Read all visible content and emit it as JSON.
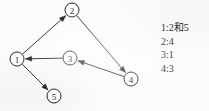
{
  "diagram": {
    "background_color": "#fcfcfc",
    "ink_color": "#1a1a1a",
    "nodes": [
      {
        "id": "1",
        "label": "1",
        "x": 17,
        "y": 59,
        "r": 7
      },
      {
        "id": "2",
        "label": "2",
        "x": 72,
        "y": 10,
        "r": 7
      },
      {
        "id": "3",
        "label": "3",
        "x": 70,
        "y": 58,
        "r": 7
      },
      {
        "id": "4",
        "label": "4",
        "x": 131,
        "y": 79,
        "r": 7
      },
      {
        "id": "5",
        "label": "5",
        "x": 54,
        "y": 96,
        "r": 7
      }
    ],
    "edges": [
      {
        "id": "e1",
        "from": "1",
        "to": "2",
        "directed": true,
        "label": "edge-1-to-2"
      },
      {
        "id": "e2",
        "from": "2",
        "to": "4",
        "directed": true,
        "label": "edge-2-to-4"
      },
      {
        "id": "e3",
        "from": "4",
        "to": "3",
        "directed": true,
        "label": "edge-4-to-3"
      },
      {
        "id": "e4",
        "from": "3",
        "to": "1",
        "directed": true,
        "label": "edge-3-to-1"
      },
      {
        "id": "e5",
        "from": "1",
        "to": "5",
        "directed": true,
        "label": "edge-1-to-5"
      }
    ]
  },
  "adjacency_list": {
    "lines": [
      {
        "key": "1",
        "text": "1:2和5"
      },
      {
        "key": "2",
        "text": "2:4"
      },
      {
        "key": "3",
        "text": "3:1"
      },
      {
        "key": "4",
        "text": "4:3"
      }
    ]
  }
}
